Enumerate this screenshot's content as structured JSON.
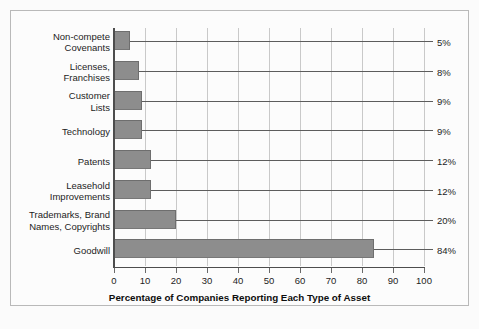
{
  "chart_data": {
    "type": "bar",
    "orientation": "horizontal",
    "title": "",
    "xlabel": "Percentage of Companies Reporting Each Type of Asset",
    "ylabel": "",
    "xlim": [
      0,
      100
    ],
    "xticks": [
      0,
      10,
      20,
      30,
      40,
      50,
      60,
      70,
      80,
      90,
      100
    ],
    "grid": "vertical",
    "legend": "none",
    "categories": [
      "Non-compete Covenants",
      "Licenses, Franchises",
      "Customer Lists",
      "Technology",
      "Patents",
      "Leasehold Improvements",
      "Trademarks, Brand Names, Copyrights",
      "Goodwill"
    ],
    "values": [
      5,
      8,
      9,
      9,
      12,
      12,
      20,
      84
    ],
    "value_labels": [
      "5%",
      "8%",
      "9%",
      "9%",
      "12%",
      "12%",
      "20%",
      "84%"
    ],
    "category_lines": [
      [
        "Non-compete",
        "Covenants"
      ],
      [
        "Licenses,",
        "Franchises"
      ],
      [
        "Customer",
        "Lists"
      ],
      [
        "Technology"
      ],
      [
        "Patents"
      ],
      [
        "Leasehold",
        "Improvements"
      ],
      [
        "Trademarks, Brand",
        "Names, Copyrights"
      ],
      [
        "Goodwill"
      ]
    ],
    "colors": {
      "bar_fill": "#8d8d8d",
      "bar_edge": "#6e6e6e",
      "gridline": "#c9c9c9",
      "axis": "#4d4d4d",
      "leader_line": "#5d5d5d",
      "text": "#1c1c1c",
      "background": "#fcfcfc",
      "frame_border": "#b9b9b9"
    }
  }
}
